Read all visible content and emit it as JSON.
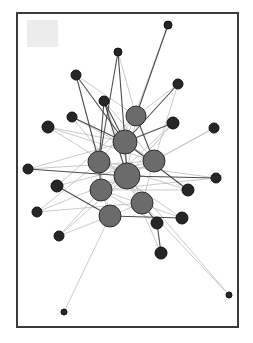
{
  "diagram": {
    "type": "network-graph",
    "frame": {
      "x": 17,
      "y": 13,
      "w": 221,
      "h": 314,
      "stroke": "#3a3a3a",
      "stroke_width": 2
    },
    "placeholder_square": {
      "x": 27,
      "y": 20,
      "w": 31,
      "h": 27,
      "fill": "#ececec"
    },
    "colors": {
      "hub_fill": "#6b6b6b",
      "hub_stroke": "#2e2e2e",
      "leaf_fill": "#262626",
      "edge_dark": "#3a3a3a",
      "edge_light": "#bdbdbd"
    },
    "hubs": [
      {
        "id": "h1",
        "x": 136,
        "y": 116,
        "r": 10
      },
      {
        "id": "h2",
        "x": 125,
        "y": 142,
        "r": 12
      },
      {
        "id": "h3",
        "x": 99,
        "y": 162,
        "r": 11
      },
      {
        "id": "h4",
        "x": 154,
        "y": 161,
        "r": 11
      },
      {
        "id": "h5",
        "x": 127,
        "y": 176,
        "r": 13
      },
      {
        "id": "h6",
        "x": 101,
        "y": 190,
        "r": 11
      },
      {
        "id": "h7",
        "x": 142,
        "y": 203,
        "r": 11
      },
      {
        "id": "h8",
        "x": 110,
        "y": 216,
        "r": 11
      }
    ],
    "leaves": [
      {
        "id": "l1",
        "x": 168,
        "y": 25,
        "r": 4
      },
      {
        "id": "l2",
        "x": 118,
        "y": 52,
        "r": 4
      },
      {
        "id": "l3",
        "x": 76,
        "y": 75,
        "r": 5
      },
      {
        "id": "l4",
        "x": 178,
        "y": 84,
        "r": 5
      },
      {
        "id": "l5",
        "x": 104,
        "y": 101,
        "r": 5
      },
      {
        "id": "l6",
        "x": 72,
        "y": 117,
        "r": 5
      },
      {
        "id": "l7",
        "x": 173,
        "y": 123,
        "r": 6
      },
      {
        "id": "l8",
        "x": 48,
        "y": 127,
        "r": 6
      },
      {
        "id": "l9",
        "x": 214,
        "y": 128,
        "r": 5
      },
      {
        "id": "l10",
        "x": 28,
        "y": 169,
        "r": 5
      },
      {
        "id": "l11",
        "x": 216,
        "y": 178,
        "r": 5
      },
      {
        "id": "l12",
        "x": 57,
        "y": 186,
        "r": 6
      },
      {
        "id": "l13",
        "x": 188,
        "y": 190,
        "r": 6
      },
      {
        "id": "l14",
        "x": 37,
        "y": 212,
        "r": 5
      },
      {
        "id": "l15",
        "x": 182,
        "y": 218,
        "r": 6
      },
      {
        "id": "l16",
        "x": 157,
        "y": 223,
        "r": 6
      },
      {
        "id": "l17",
        "x": 59,
        "y": 236,
        "r": 5
      },
      {
        "id": "l18",
        "x": 161,
        "y": 253,
        "r": 6
      },
      {
        "id": "l19",
        "x": 229,
        "y": 295,
        "r": 3
      },
      {
        "id": "l20",
        "x": 64,
        "y": 312,
        "r": 3
      }
    ],
    "edges_dark": [
      [
        "l1",
        "h1"
      ],
      [
        "l2",
        "h2"
      ],
      [
        "l2",
        "h3"
      ],
      [
        "l3",
        "h2"
      ],
      [
        "l3",
        "h3"
      ],
      [
        "l5",
        "h3"
      ],
      [
        "l5",
        "h2"
      ],
      [
        "l5",
        "h5"
      ],
      [
        "l4",
        "h2"
      ],
      [
        "l7",
        "h2"
      ],
      [
        "l6",
        "h2"
      ],
      [
        "l10",
        "h5"
      ],
      [
        "l11",
        "h5"
      ],
      [
        "l12",
        "h8"
      ],
      [
        "l15",
        "h8"
      ],
      [
        "l16",
        "h7"
      ],
      [
        "l18",
        "l16"
      ],
      [
        "l13",
        "h2"
      ],
      [
        "h3",
        "h6"
      ],
      [
        "h2",
        "h5"
      ],
      [
        "h1",
        "h4"
      ]
    ],
    "edges_light": [
      [
        "l1",
        "h2"
      ],
      [
        "l2",
        "h1"
      ],
      [
        "l3",
        "h1"
      ],
      [
        "l4",
        "h1"
      ],
      [
        "l4",
        "h4"
      ],
      [
        "l6",
        "h4"
      ],
      [
        "l6",
        "h7"
      ],
      [
        "l8",
        "h2"
      ],
      [
        "l8",
        "h5"
      ],
      [
        "l8",
        "h4"
      ],
      [
        "l9",
        "h5"
      ],
      [
        "l9",
        "h6"
      ],
      [
        "l10",
        "h4"
      ],
      [
        "l10",
        "h2"
      ],
      [
        "l11",
        "h6"
      ],
      [
        "l11",
        "h3"
      ],
      [
        "l12",
        "h4"
      ],
      [
        "l12",
        "h1"
      ],
      [
        "l13",
        "h6"
      ],
      [
        "l13",
        "h3"
      ],
      [
        "l14",
        "h3"
      ],
      [
        "l14",
        "h5"
      ],
      [
        "l14",
        "h7"
      ],
      [
        "l15",
        "h6"
      ],
      [
        "l15",
        "h3"
      ],
      [
        "l16",
        "h6"
      ],
      [
        "l17",
        "h6"
      ],
      [
        "l17",
        "h5"
      ],
      [
        "l17",
        "h8"
      ],
      [
        "l18",
        "h5"
      ],
      [
        "l19",
        "h5"
      ],
      [
        "l19",
        "h7"
      ],
      [
        "l20",
        "h8"
      ],
      [
        "l7",
        "h5"
      ],
      [
        "l7",
        "h6"
      ],
      [
        "l5",
        "h4"
      ],
      [
        "l5",
        "h7"
      ],
      [
        "h1",
        "h3"
      ],
      [
        "h1",
        "h5"
      ],
      [
        "h2",
        "h4"
      ],
      [
        "h3",
        "h5"
      ],
      [
        "h4",
        "h5"
      ],
      [
        "h5",
        "h6"
      ],
      [
        "h5",
        "h7"
      ],
      [
        "h6",
        "h8"
      ],
      [
        "h7",
        "h8"
      ],
      [
        "h4",
        "h7"
      ],
      [
        "h3",
        "h8"
      ]
    ]
  }
}
